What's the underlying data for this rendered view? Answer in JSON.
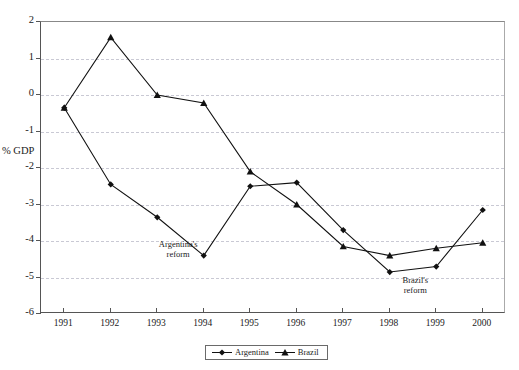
{
  "chart_data": {
    "type": "line",
    "title": "",
    "xlabel": "",
    "ylabel": "% GDP",
    "categories": [
      "1991",
      "1992",
      "1993",
      "1994",
      "1995",
      "1996",
      "1997",
      "1998",
      "1999",
      "2000"
    ],
    "ylim": [
      -6,
      2
    ],
    "yticks": [
      2,
      1,
      0,
      -1,
      -2,
      -3,
      -4,
      -5,
      -6
    ],
    "ytick_labels": [
      "2",
      "1",
      "0",
      "-1",
      "-2",
      "-3",
      "-4",
      "-5",
      "-6"
    ],
    "grid": true,
    "grid_axis": "y",
    "legend_position": "bottom-center",
    "series": [
      {
        "name": "Argentina",
        "marker": "diamond",
        "color": "#111111",
        "values": [
          -0.35,
          -2.45,
          -3.35,
          -4.4,
          -2.5,
          -2.4,
          -3.7,
          -4.85,
          -4.7,
          -3.15
        ]
      },
      {
        "name": "Brazil",
        "marker": "triangle",
        "color": "#111111",
        "values": [
          -0.35,
          1.58,
          0.0,
          -0.22,
          -2.1,
          -3.0,
          -4.15,
          -4.4,
          -4.2,
          -4.05
        ]
      }
    ],
    "annotations": [
      {
        "id": "argentina-reform",
        "line1": "Argentina's",
        "line2": "reform",
        "x_value": 1993.45,
        "y_value": -4.1
      },
      {
        "id": "brazil-reform",
        "line1": "Brazil's",
        "line2": "reform",
        "x_value": 1998.55,
        "y_value": -5.1
      }
    ]
  }
}
